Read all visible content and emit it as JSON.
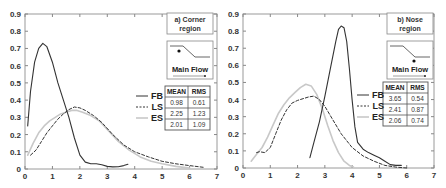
{
  "chart_data": [
    {
      "type": "line",
      "title": "a) Corner region",
      "panel_label": "a) Corner region",
      "inset_label": "Main Flow",
      "xlabel": "",
      "ylabel": "",
      "xlim": [
        0,
        7
      ],
      "ylim": [
        0,
        0.9
      ],
      "xticks": [
        "0",
        "1",
        "2",
        "3",
        "4",
        "5",
        "6",
        "7"
      ],
      "yticks": [
        "0",
        "0.1",
        "0.2",
        "0.3",
        "0.4",
        "0.5",
        "0.6",
        "0.7",
        "0.8",
        "0.9"
      ],
      "grid": false,
      "legend": [
        "FB",
        "LS",
        "ES"
      ],
      "legend_position": "center-right",
      "table": {
        "headers": [
          "MEAN",
          "RMS"
        ],
        "rows": [
          [
            "0.98",
            "0.61"
          ],
          [
            "2.25",
            "1.23"
          ],
          [
            "2.01",
            "1.09"
          ]
        ]
      },
      "series": [
        {
          "name": "FB",
          "style": "solid",
          "color": "#333333",
          "x": [
            0.1,
            0.2,
            0.35,
            0.5,
            0.65,
            0.8,
            1.0,
            1.2,
            1.4,
            1.6,
            1.8,
            2.0,
            2.2,
            2.4,
            2.6,
            2.8,
            3.0,
            3.2,
            3.4,
            3.6,
            3.75
          ],
          "y": [
            0.25,
            0.45,
            0.62,
            0.7,
            0.73,
            0.71,
            0.62,
            0.5,
            0.4,
            0.3,
            0.18,
            0.08,
            0.04,
            0.03,
            0.03,
            0.025,
            0.015,
            0.012,
            0.013,
            0.02,
            0.028
          ]
        },
        {
          "name": "LS",
          "style": "dashed",
          "color": "#333333",
          "x": [
            0.2,
            0.4,
            0.6,
            0.8,
            1.0,
            1.2,
            1.4,
            1.6,
            1.8,
            2.0,
            2.2,
            2.5,
            2.8,
            3.2,
            3.6,
            4.0,
            4.5,
            5.0,
            5.5,
            6.0,
            6.5
          ],
          "y": [
            0.08,
            0.11,
            0.16,
            0.21,
            0.25,
            0.29,
            0.32,
            0.345,
            0.36,
            0.355,
            0.34,
            0.31,
            0.27,
            0.2,
            0.14,
            0.1,
            0.07,
            0.045,
            0.03,
            0.02,
            0.01
          ]
        },
        {
          "name": "ES",
          "style": "solid-light",
          "color": "#c8c8c8",
          "x": [
            0.1,
            0.3,
            0.5,
            0.7,
            0.9,
            1.1,
            1.3,
            1.5,
            1.7,
            1.9,
            2.1,
            2.4,
            2.7,
            3.0,
            3.4,
            3.8,
            4.2,
            4.6,
            5.0,
            5.5,
            6.0
          ],
          "y": [
            0.08,
            0.15,
            0.21,
            0.25,
            0.28,
            0.3,
            0.32,
            0.33,
            0.34,
            0.34,
            0.33,
            0.31,
            0.28,
            0.23,
            0.16,
            0.11,
            0.07,
            0.045,
            0.03,
            0.015,
            0.005
          ]
        }
      ]
    },
    {
      "type": "line",
      "title": "b) Nose region",
      "panel_label": "b) Nose region",
      "inset_label": "Main Flow",
      "xlabel": "",
      "ylabel": "",
      "xlim": [
        0,
        7
      ],
      "ylim": [
        0,
        0.9
      ],
      "xticks": [
        "0",
        "1",
        "2",
        "3",
        "4",
        "5",
        "6",
        "7"
      ],
      "yticks": [
        "0",
        "0.1",
        "0.2",
        "0.3",
        "0.4",
        "0.5",
        "0.6",
        "0.7",
        "0.8",
        "0.9"
      ],
      "grid": false,
      "legend": [
        "FB",
        "LS",
        "ES"
      ],
      "legend_position": "center-right",
      "table": {
        "headers": [
          "MEAN",
          "RMS"
        ],
        "rows": [
          [
            "3.65",
            "0.54"
          ],
          [
            "2.41",
            "0.87"
          ],
          [
            "2.06",
            "0.74"
          ]
        ]
      },
      "series": [
        {
          "name": "FB",
          "style": "solid",
          "color": "#333333",
          "x": [
            2.45,
            2.6,
            2.8,
            3.0,
            3.2,
            3.4,
            3.5,
            3.6,
            3.7,
            3.8,
            3.9,
            4.0,
            4.1,
            4.2,
            4.4,
            4.6,
            4.8,
            5.0,
            5.2,
            5.4,
            5.6,
            5.8
          ],
          "y": [
            0.06,
            0.15,
            0.27,
            0.42,
            0.58,
            0.74,
            0.81,
            0.83,
            0.82,
            0.74,
            0.58,
            0.4,
            0.24,
            0.15,
            0.11,
            0.09,
            0.075,
            0.06,
            0.04,
            0.02,
            0.015,
            0.015
          ]
        },
        {
          "name": "LS",
          "style": "dashed",
          "color": "#333333",
          "x": [
            0.5,
            0.6,
            0.8,
            1.0,
            1.2,
            1.4,
            1.6,
            1.8,
            2.0,
            2.2,
            2.4,
            2.6,
            2.8,
            3.0,
            3.3,
            3.6,
            4.0,
            4.4,
            4.8,
            5.2,
            5.6,
            6.0
          ],
          "y": [
            0.09,
            0.095,
            0.09,
            0.12,
            0.2,
            0.28,
            0.34,
            0.38,
            0.395,
            0.405,
            0.415,
            0.42,
            0.4,
            0.36,
            0.28,
            0.2,
            0.12,
            0.07,
            0.04,
            0.015,
            0.005,
            0.0
          ]
        },
        {
          "name": "ES",
          "style": "solid-light",
          "color": "#c8c8c8",
          "x": [
            0.3,
            0.5,
            0.7,
            0.9,
            1.1,
            1.3,
            1.5,
            1.7,
            1.9,
            2.1,
            2.3,
            2.5,
            2.7,
            2.9,
            3.1,
            3.3,
            3.5,
            3.7,
            3.9,
            4.05
          ],
          "y": [
            0.04,
            0.08,
            0.12,
            0.18,
            0.25,
            0.32,
            0.37,
            0.41,
            0.44,
            0.47,
            0.49,
            0.48,
            0.43,
            0.35,
            0.25,
            0.16,
            0.09,
            0.04,
            0.015,
            0.005
          ]
        }
      ]
    }
  ]
}
